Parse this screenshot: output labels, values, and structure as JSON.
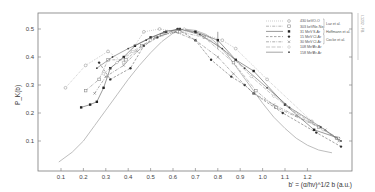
{
  "chart_data": {
    "type": "line",
    "title": "",
    "xlabel": "b' = (α/hν)^1/2 b (a.u.)",
    "ylabel": "P_K(b)",
    "xlim": [
      0.05,
      1.35
    ],
    "ylim": [
      0.0,
      0.56
    ],
    "x_ticks": [
      "0.1",
      "0.2",
      "0.3",
      "0.4",
      "0.5",
      "0.6",
      "0.7",
      "0.8",
      "0.9",
      "1.0",
      "1.1",
      "1.2"
    ],
    "y_ticks": [
      "0.1",
      "0.2",
      "0.3",
      "0.4",
      "0.5"
    ],
    "grid": false,
    "legend_position": "upper right",
    "legend_groups": [
      {
        "label": "Luz et al.",
        "series": [
          0,
          1
        ]
      },
      {
        "label": "Hoffmann et al.",
        "series": [
          2
        ]
      },
      {
        "label": "Cocke et al.",
        "series": [
          3,
          4
        ]
      }
    ],
    "series": [
      {
        "name": "430 keV O-O",
        "energy": "430 keV",
        "system": "O-O",
        "marker": "open-circle",
        "line": "dotted",
        "color": "#9a9a9a",
        "x": [
          0.12,
          0.21,
          0.31,
          0.38,
          0.47,
          0.54,
          0.62,
          0.7,
          0.82,
          0.88,
          1.02,
          1.22
        ],
        "y": [
          0.29,
          0.37,
          0.42,
          0.38,
          0.49,
          0.5,
          0.49,
          0.49,
          0.46,
          0.43,
          0.32,
          0.17
        ]
      },
      {
        "name": "303 keV Ne-Ne",
        "energy": "303 keV",
        "system": "Ne-Ne",
        "marker": "open-square",
        "line": "dash-dot",
        "color": "#8a8a8a",
        "x": [
          0.21,
          0.27,
          0.31,
          0.39,
          0.46,
          0.55,
          0.63,
          0.74,
          0.87,
          0.97,
          1.06,
          1.25,
          1.33
        ],
        "y": [
          0.28,
          0.32,
          0.39,
          0.39,
          0.44,
          0.48,
          0.49,
          0.47,
          0.38,
          0.28,
          0.22,
          0.15,
          0.11
        ]
      },
      {
        "name": "31 MeV S-Ar",
        "energy": "31 MeV",
        "system": "S-Ar",
        "marker": "filled-square",
        "line": "solid",
        "color": "#555555",
        "x": [
          0.19,
          0.23,
          0.26,
          0.29,
          0.32,
          0.38,
          0.43,
          0.5,
          0.57,
          0.63,
          0.7,
          0.8,
          0.88,
          0.96,
          1.1,
          1.23,
          1.34
        ],
        "y": [
          0.22,
          0.23,
          0.24,
          0.29,
          0.36,
          0.4,
          0.44,
          0.47,
          0.49,
          0.5,
          0.49,
          0.46,
          0.39,
          0.35,
          0.23,
          0.14,
          0.11
        ]
      },
      {
        "name": "15 MeV Cl-Ar",
        "energy": "15 MeV",
        "system": "Cl-Ar",
        "marker": "filled-circle",
        "line": "dashed",
        "color": "#666666",
        "x": [
          0.27,
          0.32,
          0.41,
          0.47,
          0.53,
          0.62,
          0.7,
          0.77,
          0.86,
          0.92,
          0.96,
          1.09,
          1.24,
          1.35
        ],
        "y": [
          0.38,
          0.32,
          0.36,
          0.44,
          0.47,
          0.5,
          0.46,
          0.39,
          0.33,
          0.3,
          0.27,
          0.2,
          0.13,
          0.08
        ]
      },
      {
        "name": "30 MeV Cl-Ar",
        "energy": "30 MeV",
        "system": "Cl-Ar",
        "marker": "cross",
        "line": "dash-dot",
        "color": "#7a7a7a",
        "x": [
          0.25,
          0.3,
          0.38,
          0.44,
          0.52,
          0.61,
          0.7,
          0.8,
          0.87,
          0.96,
          1.05,
          1.15,
          1.28,
          1.34
        ],
        "y": [
          0.27,
          0.33,
          0.37,
          0.42,
          0.47,
          0.49,
          0.46,
          0.4,
          0.34,
          0.27,
          0.23,
          0.19,
          0.14,
          0.1
        ]
      },
      {
        "name": "108 MeV Br-Ar",
        "energy": "108 MeV",
        "system": "Br-Ar",
        "marker": "open-diamond",
        "line": "long-dash",
        "color": "#a0a0a0",
        "x": [
          0.29,
          0.35,
          0.42,
          0.5,
          0.58,
          0.65,
          0.75,
          0.85,
          0.95,
          1.05,
          1.15,
          1.27,
          1.34
        ],
        "y": [
          0.34,
          0.38,
          0.42,
          0.46,
          0.49,
          0.5,
          0.47,
          0.41,
          0.33,
          0.26,
          0.2,
          0.14,
          0.11
        ]
      },
      {
        "name": "158 MeV Br-Ar",
        "energy": "158 MeV",
        "system": "Br-Ar",
        "marker": "filled-small",
        "line": "solid-thin",
        "color": "#6a6a6a",
        "x": [
          0.26,
          0.33,
          0.4,
          0.48,
          0.56,
          0.63,
          0.72,
          0.82,
          0.92,
          1.02,
          1.12,
          1.26,
          1.35
        ],
        "y": [
          0.36,
          0.4,
          0.43,
          0.46,
          0.49,
          0.5,
          0.48,
          0.43,
          0.36,
          0.29,
          0.22,
          0.15,
          0.1
        ]
      }
    ],
    "theory_curve": {
      "name": "theory",
      "color": "#b5b5b5",
      "x": [
        0.09,
        0.15,
        0.2,
        0.25,
        0.3,
        0.35,
        0.4,
        0.45,
        0.5,
        0.55,
        0.6,
        0.65,
        0.7,
        0.75,
        0.8,
        0.85,
        0.9,
        0.95,
        1.0,
        1.05,
        1.1,
        1.15,
        1.2,
        1.25,
        1.31
      ],
      "y": [
        0.025,
        0.06,
        0.1,
        0.155,
        0.21,
        0.265,
        0.32,
        0.37,
        0.415,
        0.455,
        0.485,
        0.5,
        0.495,
        0.48,
        0.445,
        0.4,
        0.345,
        0.29,
        0.235,
        0.185,
        0.145,
        0.11,
        0.085,
        0.068,
        0.058
      ]
    },
    "error_bar": {
      "x": 0.8,
      "y": 0.46,
      "dy": 0.03
    }
  },
  "side_note": "I.1232 - FB"
}
